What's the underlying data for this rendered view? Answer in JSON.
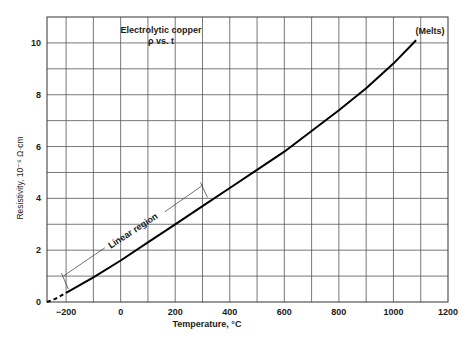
{
  "chart_data": {
    "type": "line",
    "title": "Electrolytic copper",
    "subtitle": "ρ vs. t",
    "xlabel": "Temperature, °C",
    "ylabel": "Resistivity, 10⁻⁶ Ω·cm",
    "xlim": [
      -270,
      1200
    ],
    "ylim": [
      0,
      11
    ],
    "grid": true,
    "x_ticks": [
      -200,
      0,
      200,
      400,
      600,
      800,
      1000,
      1200
    ],
    "x_tick_labels": [
      "−200",
      "0",
      "200",
      "400",
      "600",
      "800",
      "1000",
      "1200"
    ],
    "y_ticks": [
      0,
      2,
      4,
      6,
      8,
      10
    ],
    "y_tick_labels": [
      "0",
      "2",
      "4",
      "6",
      "8",
      "10"
    ],
    "series": [
      {
        "name": "Electrolytic copper resistivity (extrapolated, dashed)",
        "style": "dashed",
        "x": [
          -270,
          -240,
          -200
        ],
        "y": [
          0.0,
          0.12,
          0.35
        ]
      },
      {
        "name": "Electrolytic copper resistivity",
        "style": "solid",
        "x": [
          -200,
          -100,
          0,
          100,
          200,
          300,
          400,
          500,
          600,
          700,
          800,
          900,
          1000,
          1083
        ],
        "y": [
          0.35,
          0.95,
          1.6,
          2.3,
          3.0,
          3.7,
          4.4,
          5.1,
          5.8,
          6.6,
          7.4,
          8.25,
          9.2,
          10.1
        ]
      }
    ],
    "annotations": [
      {
        "text": "(Melts)",
        "x": 1083,
        "y": 10.1
      },
      {
        "text": "Linear region",
        "from": [
          -210,
          1.0
        ],
        "to": [
          300,
          4.5
        ]
      }
    ]
  }
}
